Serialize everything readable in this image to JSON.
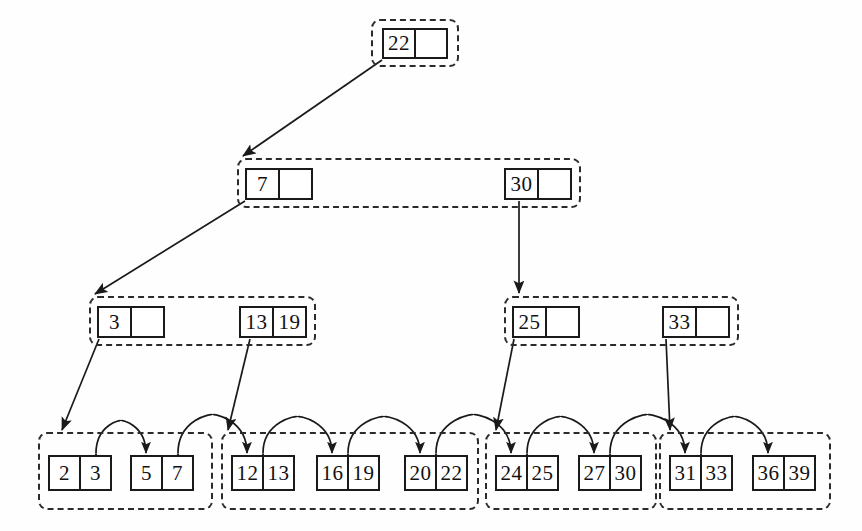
{
  "diagram": {
    "type": "b-plus-tree",
    "stroke_color": "#1a1a1a",
    "dash_color": "#2b2b2b",
    "background": "#ffffff",
    "levels": [
      {
        "name": "root-level",
        "groups": [
          {
            "id": "root-group",
            "x": 371,
            "y": 19,
            "w": 88,
            "h": 48,
            "nodes": [
              {
                "id": "root-node",
                "x": 382,
                "y": 28,
                "w": 66,
                "h": 31,
                "cells": [
                  {
                    "value": "22",
                    "empty": false
                  },
                  {
                    "value": "",
                    "empty": true
                  }
                ]
              }
            ]
          }
        ]
      },
      {
        "name": "internal-level-1",
        "groups": [
          {
            "id": "internal-group-1",
            "x": 237,
            "y": 158,
            "w": 344,
            "h": 50,
            "nodes": [
              {
                "id": "internal-node-7",
                "x": 245,
                "y": 168,
                "w": 68,
                "h": 32,
                "cells": [
                  {
                    "value": "7",
                    "empty": false
                  },
                  {
                    "value": "",
                    "empty": true
                  }
                ]
              },
              {
                "id": "internal-node-30",
                "x": 504,
                "y": 168,
                "w": 68,
                "h": 32,
                "cells": [
                  {
                    "value": "30",
                    "empty": false
                  },
                  {
                    "value": "",
                    "empty": true
                  }
                ]
              }
            ]
          }
        ]
      },
      {
        "name": "internal-level-2",
        "groups": [
          {
            "id": "internal-group-2a",
            "x": 89,
            "y": 296,
            "w": 227,
            "h": 50,
            "nodes": [
              {
                "id": "internal-node-3",
                "x": 97,
                "y": 306,
                "w": 68,
                "h": 32,
                "cells": [
                  {
                    "value": "3",
                    "empty": false
                  },
                  {
                    "value": "",
                    "empty": true
                  }
                ]
              },
              {
                "id": "internal-node-13-19",
                "x": 239,
                "y": 306,
                "w": 68,
                "h": 32,
                "cells": [
                  {
                    "value": "13",
                    "empty": false
                  },
                  {
                    "value": "19",
                    "empty": false
                  }
                ]
              }
            ]
          },
          {
            "id": "internal-group-2b",
            "x": 504,
            "y": 296,
            "w": 235,
            "h": 50,
            "nodes": [
              {
                "id": "internal-node-25",
                "x": 512,
                "y": 306,
                "w": 68,
                "h": 32,
                "cells": [
                  {
                    "value": "25",
                    "empty": false
                  },
                  {
                    "value": "",
                    "empty": true
                  }
                ]
              },
              {
                "id": "internal-node-33",
                "x": 662,
                "y": 306,
                "w": 68,
                "h": 32,
                "cells": [
                  {
                    "value": "33",
                    "empty": false
                  },
                  {
                    "value": "",
                    "empty": true
                  }
                ]
              }
            ]
          }
        ]
      },
      {
        "name": "leaf-level",
        "groups": [
          {
            "id": "leaf-group-1",
            "x": 38,
            "y": 432,
            "w": 175,
            "h": 78,
            "nodes": [
              {
                "id": "leaf-node-2-3",
                "x": 48,
                "y": 455,
                "w": 64,
                "h": 36,
                "cells": [
                  {
                    "value": "2",
                    "empty": false
                  },
                  {
                    "value": "3",
                    "empty": false
                  }
                ]
              },
              {
                "id": "leaf-node-5-7",
                "x": 130,
                "y": 455,
                "w": 64,
                "h": 36,
                "cells": [
                  {
                    "value": "5",
                    "empty": false
                  },
                  {
                    "value": "7",
                    "empty": false
                  }
                ]
              }
            ]
          },
          {
            "id": "leaf-group-2",
            "x": 221,
            "y": 432,
            "w": 258,
            "h": 78,
            "nodes": [
              {
                "id": "leaf-node-12-13",
                "x": 231,
                "y": 455,
                "w": 64,
                "h": 36,
                "cells": [
                  {
                    "value": "12",
                    "empty": false
                  },
                  {
                    "value": "13",
                    "empty": false
                  }
                ]
              },
              {
                "id": "leaf-node-16-19",
                "x": 316,
                "y": 455,
                "w": 64,
                "h": 36,
                "cells": [
                  {
                    "value": "16",
                    "empty": false
                  },
                  {
                    "value": "19",
                    "empty": false
                  }
                ]
              },
              {
                "id": "leaf-node-20-22",
                "x": 404,
                "y": 455,
                "w": 64,
                "h": 36,
                "cells": [
                  {
                    "value": "20",
                    "empty": false
                  },
                  {
                    "value": "22",
                    "empty": false
                  }
                ]
              }
            ]
          },
          {
            "id": "leaf-group-3",
            "x": 485,
            "y": 432,
            "w": 172,
            "h": 78,
            "nodes": [
              {
                "id": "leaf-node-24-25",
                "x": 495,
                "y": 455,
                "w": 64,
                "h": 36,
                "cells": [
                  {
                    "value": "24",
                    "empty": false
                  },
                  {
                    "value": "25",
                    "empty": false
                  }
                ]
              },
              {
                "id": "leaf-node-27-30",
                "x": 578,
                "y": 455,
                "w": 64,
                "h": 36,
                "cells": [
                  {
                    "value": "27",
                    "empty": false
                  },
                  {
                    "value": "30",
                    "empty": false
                  }
                ]
              }
            ]
          },
          {
            "id": "leaf-group-4",
            "x": 659,
            "y": 432,
            "w": 172,
            "h": 78,
            "nodes": [
              {
                "id": "leaf-node-31-33",
                "x": 669,
                "y": 455,
                "w": 64,
                "h": 36,
                "cells": [
                  {
                    "value": "31",
                    "empty": false
                  },
                  {
                    "value": "33",
                    "empty": false
                  }
                ]
              },
              {
                "id": "leaf-node-36-39",
                "x": 752,
                "y": 455,
                "w": 64,
                "h": 36,
                "cells": [
                  {
                    "value": "36",
                    "empty": false
                  },
                  {
                    "value": "39",
                    "empty": false
                  }
                ]
              }
            ]
          }
        ]
      }
    ],
    "pointer_edges": [
      {
        "id": "edge-root-to-7",
        "from": "root-node",
        "to": "internal-group-1",
        "x1": 382,
        "y1": 60,
        "x2": 243,
        "y2": 156
      },
      {
        "id": "edge-7-to-3",
        "from": "internal-node-7",
        "to": "internal-group-2a",
        "x1": 245,
        "y1": 201,
        "x2": 95,
        "y2": 294
      },
      {
        "id": "edge-30-to-25",
        "from": "internal-node-30",
        "to": "internal-group-2b",
        "x1": 519,
        "y1": 201,
        "x2": 519,
        "y2": 293
      },
      {
        "id": "edge-3-to-leaf1",
        "from": "internal-node-3",
        "to": "leaf-group-1",
        "x1": 99,
        "y1": 339,
        "x2": 62,
        "y2": 430
      },
      {
        "id": "edge-1319-to-leaf2",
        "from": "internal-node-13-19",
        "to": "leaf-group-2",
        "x1": 250,
        "y1": 339,
        "x2": 228,
        "y2": 430
      },
      {
        "id": "edge-25-to-leaf3",
        "from": "internal-node-25",
        "to": "leaf-group-3",
        "x1": 514,
        "y1": 339,
        "x2": 496,
        "y2": 430
      },
      {
        "id": "edge-33-to-leaf4",
        "from": "internal-node-33",
        "to": "leaf-group-4",
        "x1": 666,
        "y1": 339,
        "x2": 670,
        "y2": 430
      }
    ],
    "sibling_links": [
      {
        "id": "link-23-to-57",
        "from": "leaf-node-2-3",
        "to": "leaf-node-5-7",
        "x1": 96,
        "x2": 146,
        "y": 453,
        "lift": 28
      },
      {
        "id": "link-57-to-1213",
        "from": "leaf-node-5-7",
        "to": "leaf-node-12-13",
        "x1": 178,
        "x2": 247,
        "y": 453,
        "lift": 34
      },
      {
        "id": "link-1213-to-1619",
        "from": "leaf-node-12-13",
        "to": "leaf-node-16-19",
        "x1": 263,
        "x2": 332,
        "y": 453,
        "lift": 32
      },
      {
        "id": "link-1619-to-2022",
        "from": "leaf-node-16-19",
        "to": "leaf-node-20-22",
        "x1": 348,
        "x2": 420,
        "y": 453,
        "lift": 32
      },
      {
        "id": "link-2022-to-2425",
        "from": "leaf-node-20-22",
        "to": "leaf-node-24-25",
        "x1": 436,
        "x2": 511,
        "y": 453,
        "lift": 34
      },
      {
        "id": "link-2425-to-2730",
        "from": "leaf-node-24-25",
        "to": "leaf-node-27-30",
        "x1": 527,
        "x2": 594,
        "y": 453,
        "lift": 32
      },
      {
        "id": "link-2730-to-3133",
        "from": "leaf-node-27-30",
        "to": "leaf-node-31-33",
        "x1": 610,
        "x2": 685,
        "y": 453,
        "lift": 34
      },
      {
        "id": "link-3133-to-3639",
        "from": "leaf-node-31-33",
        "to": "leaf-node-36-39",
        "x1": 701,
        "x2": 768,
        "y": 453,
        "lift": 32
      }
    ]
  }
}
